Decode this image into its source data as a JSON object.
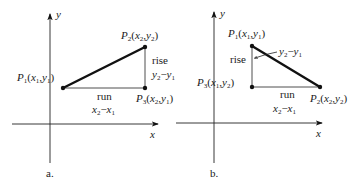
{
  "panels": [
    {
      "id": "a",
      "caption": "a.",
      "axes": {
        "x_label": "x",
        "y_label": "y"
      },
      "points": {
        "P1": {
          "name": "P",
          "sub": "1",
          "coords": "(x1,y1)"
        },
        "P2": {
          "name": "P",
          "sub": "2",
          "coords": "(x2,y2)"
        },
        "P3": {
          "name": "P",
          "sub": "3",
          "coords": "(x2,y1)"
        }
      },
      "rise": {
        "label": "rise",
        "expr": "y2−y1"
      },
      "run": {
        "label": "run",
        "expr": "x2−x1"
      }
    },
    {
      "id": "b",
      "caption": "b.",
      "axes": {
        "x_label": "x",
        "y_label": "y"
      },
      "points": {
        "P1": {
          "name": "P",
          "sub": "1",
          "coords": "(x1,y1)"
        },
        "P2": {
          "name": "P",
          "sub": "2",
          "coords": "(x2,y2)"
        },
        "P3": {
          "name": "P",
          "sub": "3",
          "coords": "(x1,y2)"
        }
      },
      "rise": {
        "label": "rise",
        "expr": "y2−y1"
      },
      "run": {
        "label": "run",
        "expr": "x2−x1"
      }
    }
  ]
}
